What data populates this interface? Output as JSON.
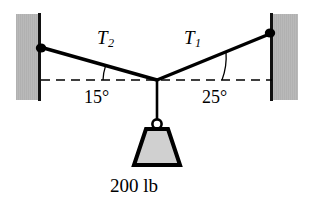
{
  "figure": {
    "type": "statics-free-body-diagram",
    "labels": {
      "tension_left": {
        "symbol": "T",
        "subscript": "2"
      },
      "tension_right": {
        "symbol": "T",
        "subscript": "1"
      },
      "angle_left": "15°",
      "angle_right": "25°",
      "weight": "200 lb"
    },
    "colors": {
      "wall_fill": "#b9b9b9",
      "wall_edge": "#111111",
      "cable": "#000000",
      "dashed_line": "#000000",
      "weight_fill": "#d0d0d0",
      "weight_edge": "#000000",
      "background": "#ffffff"
    },
    "geometry": {
      "junction": {
        "x": 157,
        "y": 80
      },
      "left_anchor": {
        "x": 39,
        "y": 47
      },
      "right_anchor": {
        "x": 272,
        "y": 33
      },
      "angle_left_degrees": 15,
      "angle_right_degrees": 25
    }
  }
}
